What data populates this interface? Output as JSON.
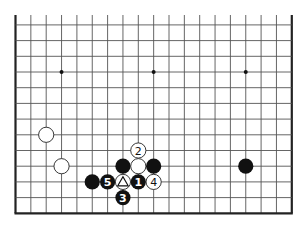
{
  "board": {
    "size": 19,
    "visible_rows": [
      6,
      18
    ],
    "visible_cols": [
      0,
      18
    ],
    "geometry": {
      "x0": 15.5,
      "dx": 15.35,
      "row_ref": 9,
      "y_ref": 72,
      "dy": 15.7,
      "top_y": 15,
      "stone_r": 7.6
    },
    "edges": {
      "left": true,
      "right": true,
      "bottom": true,
      "top": false
    },
    "star_points": [
      {
        "col": 3,
        "row": 9
      },
      {
        "col": 9,
        "row": 9
      },
      {
        "col": 15,
        "row": 9
      }
    ],
    "stones": [
      {
        "color": "white",
        "col": 2,
        "row": 13,
        "label": ""
      },
      {
        "color": "white",
        "col": 3,
        "row": 15,
        "label": ""
      },
      {
        "color": "white",
        "col": 8,
        "row": 14,
        "label": "2"
      },
      {
        "color": "black",
        "col": 7,
        "row": 15,
        "label": ""
      },
      {
        "color": "white",
        "col": 8,
        "row": 15,
        "label": ""
      },
      {
        "color": "black",
        "col": 9,
        "row": 15,
        "label": ""
      },
      {
        "color": "black",
        "col": 5,
        "row": 16,
        "label": ""
      },
      {
        "color": "black",
        "col": 6,
        "row": 16,
        "label": "5"
      },
      {
        "color": "white",
        "col": 7,
        "row": 16,
        "label": "",
        "marker": "triangle"
      },
      {
        "color": "black",
        "col": 8,
        "row": 16,
        "label": "1"
      },
      {
        "color": "white",
        "col": 9,
        "row": 16,
        "label": "4"
      },
      {
        "color": "black",
        "col": 7,
        "row": 17,
        "label": "3"
      },
      {
        "color": "black",
        "col": 15,
        "row": 15,
        "label": ""
      }
    ]
  },
  "colors": {
    "black_stone": "#111111",
    "white_stone": "#ffffff",
    "grid": "#555555",
    "background": "#ffffff"
  }
}
